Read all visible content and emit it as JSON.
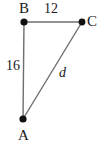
{
  "figure": {
    "kind": "geometry-diagram",
    "background_color": "#ffffff",
    "line_color": "#6e6e6e",
    "text_color": "#1a1a1a",
    "vertices": [
      {
        "id": "A",
        "label": "A",
        "x": 23,
        "y": 119
      },
      {
        "id": "B",
        "label": "B",
        "x": 24,
        "y": 22
      },
      {
        "id": "C",
        "label": "C",
        "x": 82,
        "y": 22
      }
    ],
    "edges": [
      {
        "id": "BC",
        "from": "B",
        "to": "C",
        "label": "12"
      },
      {
        "id": "AB",
        "from": "A",
        "to": "B",
        "label": "16"
      },
      {
        "id": "AC",
        "from": "A",
        "to": "C",
        "label": "d"
      }
    ],
    "labels": {
      "vertex_a": "A",
      "vertex_b": "B",
      "vertex_c": "C",
      "side_top": "12",
      "side_left": "16",
      "side_diagonal": "d"
    }
  }
}
